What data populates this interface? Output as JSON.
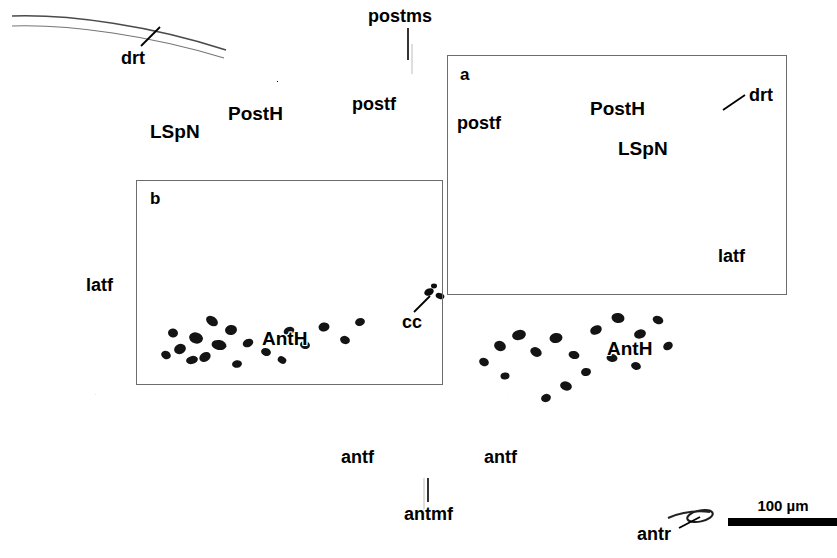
{
  "figure": {
    "type": "histology-micrograph",
    "background_color": "#ffffff",
    "stain_color": "#000000",
    "width": 837,
    "height": 558
  },
  "scalebar": {
    "label": "100 µm",
    "bar_length_px": 110,
    "x": 728,
    "y": 512
  },
  "roi_boxes": [
    {
      "letter": "a",
      "x": 447,
      "y": 55,
      "width": 340,
      "height": 240,
      "letter_x": 460,
      "letter_y": 66,
      "border_color": "#6d6d6d"
    },
    {
      "letter": "b",
      "x": 136,
      "y": 180,
      "width": 307,
      "height": 205,
      "letter_x": 150,
      "letter_y": 190,
      "border_color": "#6d6d6d"
    }
  ],
  "labels": [
    {
      "text": "drt",
      "x": 121,
      "y": 49,
      "size": "lbl-md",
      "name": "label-drt-left"
    },
    {
      "text": "postms",
      "x": 368,
      "y": 7,
      "size": "lbl-md",
      "name": "label-postms"
    },
    {
      "text": "PostH",
      "x": 228,
      "y": 104,
      "size": "lbl-lg",
      "name": "label-posth-left"
    },
    {
      "text": "LSpN",
      "x": 150,
      "y": 122,
      "size": "lbl-lg",
      "name": "label-lspn-left"
    },
    {
      "text": "postf",
      "x": 352,
      "y": 95,
      "size": "lbl-md",
      "name": "label-postf-left"
    },
    {
      "text": "postf",
      "x": 457,
      "y": 114,
      "size": "lbl-md",
      "name": "label-postf-right"
    },
    {
      "text": "PostH",
      "x": 590,
      "y": 99,
      "size": "lbl-lg",
      "name": "label-posth-right"
    },
    {
      "text": "LSpN",
      "x": 618,
      "y": 139,
      "size": "lbl-lg",
      "name": "label-lspn-right"
    },
    {
      "text": "drt",
      "x": 749,
      "y": 86,
      "size": "lbl-md",
      "name": "label-drt-right"
    },
    {
      "text": "latf",
      "x": 718,
      "y": 247,
      "size": "lbl-md",
      "name": "label-latf-right"
    },
    {
      "text": "latf",
      "x": 86,
      "y": 276,
      "size": "lbl-md",
      "name": "label-latf-left"
    },
    {
      "text": "cc",
      "x": 402,
      "y": 313,
      "size": "lbl-md",
      "name": "label-cc"
    },
    {
      "text": "AntH",
      "x": 262,
      "y": 329,
      "size": "lbl-lg",
      "name": "label-anth-left"
    },
    {
      "text": "AntH",
      "x": 607,
      "y": 339,
      "size": "lbl-lg",
      "name": "label-anth-right"
    },
    {
      "text": "antf",
      "x": 341,
      "y": 448,
      "size": "lbl-md",
      "name": "label-antf-left"
    },
    {
      "text": "antf",
      "x": 484,
      "y": 448,
      "size": "lbl-md",
      "name": "label-antf-right"
    },
    {
      "text": "antmf",
      "x": 404,
      "y": 505,
      "size": "lbl-md",
      "name": "label-antmf"
    },
    {
      "text": "antr",
      "x": 637,
      "y": 525,
      "size": "lbl-md",
      "name": "label-antr"
    }
  ],
  "abbreviations": {
    "drt": "dorsal root",
    "postms": "posterior median sulcus",
    "postf": "posterior funiculus",
    "PostH": "posterior horn",
    "LSpN": "lateral spinal nucleus",
    "latf": "lateral funiculus",
    "AntH": "anterior horn",
    "antf": "anterior funiculus",
    "antmf": "anterior median fissure",
    "antr": "anterior root",
    "cc": "central canal"
  }
}
